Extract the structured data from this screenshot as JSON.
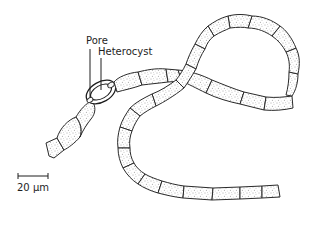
{
  "figure": {
    "labels": {
      "pore": "Pore",
      "heterocyst": "Heterocyst"
    },
    "scale_bar": {
      "label": "20 µm"
    },
    "colors": {
      "line": "#1e1e1e",
      "stipple": "#555555",
      "background": "#ffffff"
    }
  }
}
